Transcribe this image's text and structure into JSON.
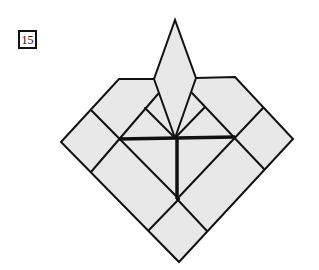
{
  "step": {
    "number": "15"
  },
  "diagram": {
    "fill_color": "#e8e8e8",
    "line_color": "#111111"
  }
}
